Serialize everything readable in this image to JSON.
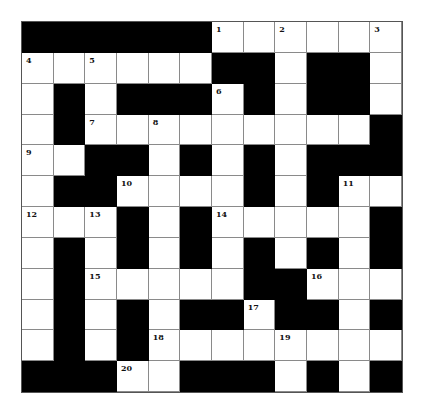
{
  "puzzle": {
    "rows": 12,
    "cols": 12,
    "layout": [
      "BBBBBBWWWWWW",
      "WWWWWWBBWBBW",
      "WBWBBBWBWBBW",
      "WBWWWWWWWWWB",
      "WWBBWBWBWBBB",
      "WBBWWWWBWBWW",
      "WWWBWBWWWWWB",
      "WBWBWBWBWBWB",
      "WBWWWWWBBWWW",
      "WBWBWBBWBBWB",
      "WBWBWWWWWWWW",
      "BBBWWBBBWBWB"
    ],
    "numbers": [
      {
        "row": 0,
        "col": 6,
        "n": "1"
      },
      {
        "row": 0,
        "col": 8,
        "n": "2"
      },
      {
        "row": 0,
        "col": 11,
        "n": "3"
      },
      {
        "row": 1,
        "col": 0,
        "n": "4"
      },
      {
        "row": 1,
        "col": 2,
        "n": "5"
      },
      {
        "row": 2,
        "col": 6,
        "n": "6"
      },
      {
        "row": 3,
        "col": 2,
        "n": "7"
      },
      {
        "row": 3,
        "col": 4,
        "n": "8"
      },
      {
        "row": 4,
        "col": 0,
        "n": "9"
      },
      {
        "row": 5,
        "col": 3,
        "n": "10"
      },
      {
        "row": 5,
        "col": 10,
        "n": "11"
      },
      {
        "row": 6,
        "col": 0,
        "n": "12"
      },
      {
        "row": 6,
        "col": 2,
        "n": "13"
      },
      {
        "row": 6,
        "col": 6,
        "n": "14"
      },
      {
        "row": 8,
        "col": 2,
        "n": "15"
      },
      {
        "row": 8,
        "col": 9,
        "n": "16"
      },
      {
        "row": 9,
        "col": 7,
        "n": "17"
      },
      {
        "row": 10,
        "col": 4,
        "n": "18"
      },
      {
        "row": 10,
        "col": 8,
        "n": "19"
      },
      {
        "row": 11,
        "col": 3,
        "n": "20"
      }
    ],
    "colors": {
      "block": "#000000",
      "empty": "#ffffff",
      "gridline": "#8a8a8a"
    }
  }
}
